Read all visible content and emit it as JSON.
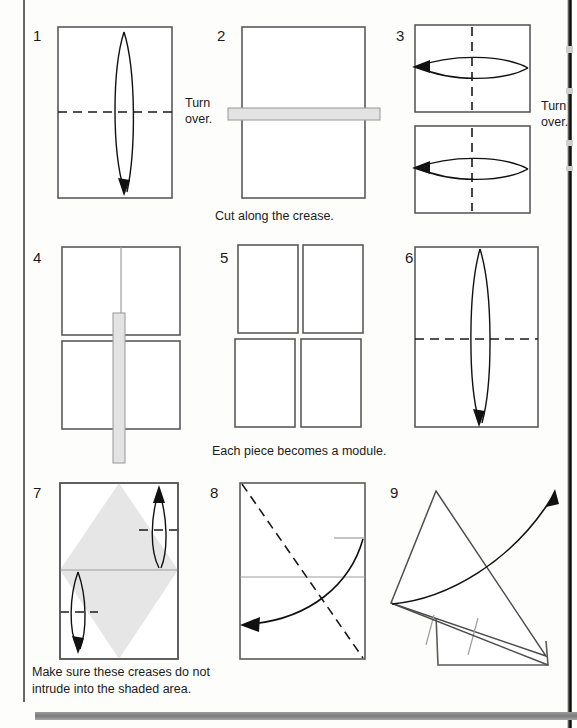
{
  "document": {
    "type": "origami-instruction-diagram",
    "title": "Modular origami folding sequence",
    "total_steps": 9
  },
  "steps": [
    {
      "number": "1",
      "shape": "portrait-rectangle",
      "markings": "vertical lens arrow pointing down, horizontal dashed crease at center",
      "side_label": "Turn\nover."
    },
    {
      "number": "2",
      "shape": "portrait-rectangle",
      "markings": "horizontal grey cut bar across center extending past both edges",
      "caption": "Cut along the crease."
    },
    {
      "number": "3",
      "shape": "two-landscape-rectangles",
      "markings": "vertical dashed centre crease, horizontal lens arrow pointing left in each",
      "side_label": "Turn\nover."
    },
    {
      "number": "4",
      "shape": "two-stacked-rectangles",
      "markings": "vertical grey cut bar through centre extending past top and bottom"
    },
    {
      "number": "5",
      "shape": "four-separate-rectangles",
      "markings": "two-by-two grid of loose pieces",
      "caption": "Each piece becomes a module."
    },
    {
      "number": "6",
      "shape": "portrait-rectangle",
      "markings": "vertical lens arrow pointing down, horizontal dashed crease at centre"
    },
    {
      "number": "7",
      "shape": "portrait-rectangle-with-shaded-diamond",
      "markings": "shaded diamond, light horizontal centre line, small lens arrow up at right, small lens arrow down at left, short dashed crease marks",
      "caption": "Make sure these creases do not\nintrude into the shaded area."
    },
    {
      "number": "8",
      "shape": "portrait-rectangle",
      "markings": "diagonal dashed crease top-left to bottom-right, light horizontal centre line, curved arrow sweeping to lower left"
    },
    {
      "number": "9",
      "shape": "rotated-triangle-over-rectangle",
      "markings": "tilted triangle above partial rectangle with light fold lines and curved arrow sweeping up to the right"
    }
  ],
  "colors": {
    "paper_stroke": "#5a5a5a",
    "crease_dark": "#1a1a1a",
    "crease_light": "#9d9d9d",
    "cut_bar": "#e3e3e3",
    "shaded_area": "#e6e6e6",
    "text": "#1b1b1b",
    "page_background": "#fdfdfc"
  }
}
